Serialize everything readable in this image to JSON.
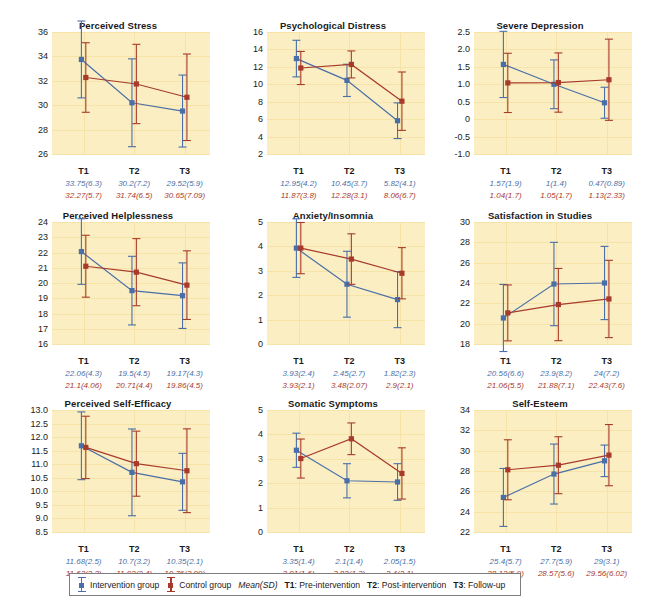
{
  "figure": {
    "colors": {
      "intervention": "#4a6fa8",
      "control": "#a83a2c",
      "plot_background": "#faeec2",
      "gridline": "#f5e3a8"
    }
  },
  "legend": {
    "intervention_label": "Intervention group",
    "control_label": "Control group",
    "meansd_label": "Mean(SD)",
    "t1_def_key": "T1",
    "t1_def_val": ": Pre-intervention",
    "t2_def_key": "T2",
    "t2_def_val": ": Post-intervention",
    "t3_def_key": "T3",
    "t3_def_val": ": Follow-up"
  },
  "xlabels": [
    "T1",
    "T2",
    "T3"
  ],
  "chart_data": [
    {
      "type": "line",
      "title": "Perceived Stress",
      "xlabel": "",
      "ylabel": "",
      "categories": [
        "T1",
        "T2",
        "T3"
      ],
      "yticks": [
        26,
        28,
        30,
        32,
        34,
        36
      ],
      "ylim": [
        26,
        36
      ],
      "grid": true,
      "legend_position": "figure-bottom",
      "series": [
        {
          "name": "Intervention group",
          "color": "#4a6fa8",
          "values": [
            33.75,
            30.2,
            29.52
          ],
          "sd": [
            6.3,
            7.2,
            5.9
          ],
          "labels": [
            "33.75(6.3)",
            "30.2(7.2)",
            "29.52(5.9)"
          ]
        },
        {
          "name": "Control group",
          "color": "#a83a2c",
          "values": [
            32.27,
            31.74,
            30.65
          ],
          "sd": [
            5.7,
            6.5,
            7.09
          ],
          "labels": [
            "32.27(5.7)",
            "31.74(6.5)",
            "30.65(7.09)"
          ]
        }
      ]
    },
    {
      "type": "line",
      "title": "Psychological Distress",
      "xlabel": "",
      "ylabel": "",
      "categories": [
        "T1",
        "T2",
        "T3"
      ],
      "yticks": [
        2,
        4,
        6,
        8,
        10,
        12,
        14,
        16
      ],
      "ylim": [
        2,
        16
      ],
      "grid": true,
      "legend_position": "figure-bottom",
      "series": [
        {
          "name": "Intervention group",
          "color": "#4a6fa8",
          "values": [
            12.95,
            10.45,
            5.82
          ],
          "sd": [
            4.2,
            3.7,
            4.1
          ],
          "labels": [
            "12.95(4.2)",
            "10.45(3.7)",
            "5.82(4.1)"
          ]
        },
        {
          "name": "Control group",
          "color": "#a83a2c",
          "values": [
            11.87,
            12.28,
            8.06
          ],
          "sd": [
            3.8,
            3.1,
            6.7
          ],
          "labels": [
            "11.87(3.8)",
            "12.28(3.1)",
            "8.06(6.7)"
          ]
        }
      ]
    },
    {
      "type": "line",
      "title": "Severe Depression",
      "xlabel": "",
      "ylabel": "",
      "categories": [
        "T1",
        "T2",
        "T3"
      ],
      "yticks": [
        -1.0,
        -0.5,
        0,
        0.5,
        1.0,
        1.5,
        2.0,
        2.5
      ],
      "ytick_labels": [
        "-1.0",
        "-0.5",
        "0",
        "0.5",
        "1.0",
        "1.5",
        "2.0",
        "2.5"
      ],
      "ylim": [
        -1.0,
        2.5
      ],
      "grid": true,
      "legend_position": "figure-bottom",
      "series": [
        {
          "name": "Intervention group",
          "color": "#4a6fa8",
          "values": [
            1.57,
            1.0,
            0.47
          ],
          "sd": [
            1.9,
            1.4,
            0.89
          ],
          "labels": [
            "1.57(1.9)",
            "1(1.4)",
            "0.47(0.89)"
          ]
        },
        {
          "name": "Control group",
          "color": "#a83a2c",
          "values": [
            1.04,
            1.05,
            1.13
          ],
          "sd": [
            1.7,
            1.7,
            2.33
          ],
          "labels": [
            "1.04(1.7)",
            "1.05(1.7)",
            "1.13(2.33)"
          ]
        }
      ]
    },
    {
      "type": "line",
      "title": "Perceived Helplessness",
      "xlabel": "",
      "ylabel": "",
      "categories": [
        "T1",
        "T2",
        "T3"
      ],
      "yticks": [
        16,
        17,
        18,
        19,
        20,
        21,
        22,
        23,
        24
      ],
      "ylim": [
        16,
        24
      ],
      "grid": true,
      "legend_position": "figure-bottom",
      "series": [
        {
          "name": "Intervention group",
          "color": "#4a6fa8",
          "values": [
            22.06,
            19.5,
            19.17
          ],
          "sd": [
            4.3,
            4.5,
            4.3
          ],
          "labels": [
            "22.06(4.3)",
            "19.5(4.5)",
            "19.17(4.3)"
          ]
        },
        {
          "name": "Control group",
          "color": "#a83a2c",
          "values": [
            21.1,
            20.71,
            19.86
          ],
          "sd": [
            4.06,
            4.4,
            4.5
          ],
          "labels": [
            "21.1(4.06)",
            "20.71(4.4)",
            "19.86(4.5)"
          ]
        }
      ]
    },
    {
      "type": "line",
      "title": "Anxiety/Insomnia",
      "xlabel": "",
      "ylabel": "",
      "categories": [
        "T1",
        "T2",
        "T3"
      ],
      "yticks": [
        0,
        1,
        2,
        3,
        4,
        5
      ],
      "ylim": [
        0,
        5
      ],
      "grid": true,
      "legend_position": "figure-bottom",
      "series": [
        {
          "name": "Intervention group",
          "color": "#4a6fa8",
          "values": [
            3.93,
            2.45,
            1.82
          ],
          "sd": [
            2.4,
            2.7,
            2.3
          ],
          "labels": [
            "3.93(2.4)",
            "2.45(2.7)",
            "1.82(2.3)"
          ]
        },
        {
          "name": "Control group",
          "color": "#a83a2c",
          "values": [
            3.93,
            3.48,
            2.9
          ],
          "sd": [
            2.1,
            2.07,
            2.1
          ],
          "labels": [
            "3.93(2.1)",
            "3.48(2.07)",
            "2.9(2.1)"
          ]
        }
      ]
    },
    {
      "type": "line",
      "title": "Satisfaction in Studies",
      "xlabel": "",
      "ylabel": "",
      "categories": [
        "T1",
        "T2",
        "T3"
      ],
      "yticks": [
        18,
        20,
        22,
        24,
        26,
        28,
        30
      ],
      "ylim": [
        18,
        30
      ],
      "grid": true,
      "legend_position": "figure-bottom",
      "series": [
        {
          "name": "Intervention group",
          "color": "#4a6fa8",
          "values": [
            20.56,
            23.9,
            24.0
          ],
          "sd": [
            6.6,
            8.2,
            7.2
          ],
          "labels": [
            "20.56(6.6)",
            "23.9(8.2)",
            "24(7.2)"
          ]
        },
        {
          "name": "Control group",
          "color": "#a83a2c",
          "values": [
            21.06,
            21.88,
            22.43
          ],
          "sd": [
            5.5,
            7.1,
            7.6
          ],
          "labels": [
            "21.06(5.5)",
            "21.88(7.1)",
            "22.43(7.6)"
          ]
        }
      ]
    },
    {
      "type": "line",
      "title": "Perceived Self-Efficacy",
      "xlabel": "",
      "ylabel": "",
      "categories": [
        "T1",
        "T2",
        "T3"
      ],
      "yticks": [
        8.5,
        9.0,
        9.5,
        10.0,
        10.5,
        11.0,
        11.5,
        12.0,
        12.5,
        13.0
      ],
      "ytick_labels": [
        "8.5",
        "9.0",
        "9.5",
        "10.0",
        "10.5",
        "11.0",
        "11.5",
        "12.0",
        "12.5",
        "13.0"
      ],
      "ylim": [
        8.5,
        13.0
      ],
      "grid": true,
      "legend_position": "figure-bottom",
      "series": [
        {
          "name": "Intervention group",
          "color": "#4a6fa8",
          "values": [
            11.68,
            10.7,
            10.35
          ],
          "sd": [
            2.5,
            3.2,
            2.1
          ],
          "labels": [
            "11.68(2.5)",
            "10.7(3.2)",
            "10.35(2.1)"
          ]
        },
        {
          "name": "Control group",
          "color": "#a83a2c",
          "values": [
            11.62,
            11.02,
            10.76
          ],
          "sd": [
            2.3,
            2.4,
            3.09
          ],
          "labels": [
            "11.62(2.3)",
            "11.02(2.4)",
            "10.76(3.09)"
          ]
        }
      ]
    },
    {
      "type": "line",
      "title": "Somatic Symptoms",
      "xlabel": "",
      "ylabel": "",
      "categories": [
        "T1",
        "T2",
        "T3"
      ],
      "yticks": [
        0,
        1,
        2,
        3,
        4,
        5
      ],
      "ylim": [
        0,
        5
      ],
      "grid": true,
      "legend_position": "figure-bottom",
      "series": [
        {
          "name": "Intervention group",
          "color": "#4a6fa8",
          "values": [
            3.35,
            2.1,
            2.05
          ],
          "sd": [
            1.4,
            1.4,
            1.5
          ],
          "labels": [
            "3.35(1.4)",
            "2.1(1.4)",
            "2.05(1.5)"
          ]
        },
        {
          "name": "Control group",
          "color": "#a83a2c",
          "values": [
            3.01,
            3.82,
            2.4
          ],
          "sd": [
            1.6,
            1.3,
            2.1
          ],
          "labels": [
            "3.01(1.6)",
            "3.82(1.3)",
            "2.4(2.1)"
          ]
        }
      ]
    },
    {
      "type": "line",
      "title": "Self-Esteem",
      "xlabel": "",
      "ylabel": "",
      "categories": [
        "T1",
        "T2",
        "T3"
      ],
      "yticks": [
        22,
        24,
        26,
        28,
        30,
        32,
        34
      ],
      "ylim": [
        22,
        34
      ],
      "grid": true,
      "legend_position": "figure-bottom",
      "series": [
        {
          "name": "Intervention group",
          "color": "#4a6fa8",
          "values": [
            25.4,
            27.7,
            29.0
          ],
          "sd": [
            5.7,
            5.9,
            3.1
          ],
          "labels": [
            "25.4(5.7)",
            "27.7(5.9)",
            "29(3.1)"
          ]
        },
        {
          "name": "Control group",
          "color": "#a83a2c",
          "values": [
            28.12,
            28.57,
            29.56
          ],
          "sd": [
            5.9,
            5.6,
            6.02
          ],
          "labels": [
            "28.12(5.9)",
            "28.57(5.6)",
            "29.56(6.02)"
          ]
        }
      ]
    }
  ]
}
